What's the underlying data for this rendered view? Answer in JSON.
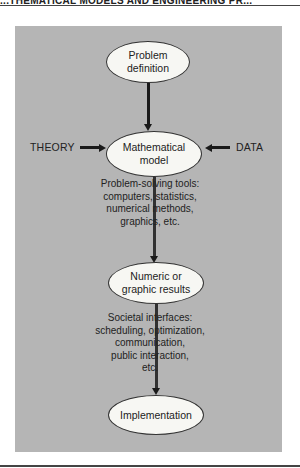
{
  "header": {
    "text": "...THEMATICAL MODELS AND ENGINEERING PR..."
  },
  "colors": {
    "panel": "#b5b5b5",
    "node_fill": "#f7f7f3",
    "line": "#1a1a1a"
  },
  "nodes": {
    "problem_definition": {
      "line1": "Problem",
      "line2": "definition"
    },
    "mathematical_model": {
      "line1": "Mathematical",
      "line2": "model"
    },
    "numeric_results": {
      "line1": "Numeric or",
      "line2": "graphic results"
    },
    "implementation": {
      "line1": "Implementation"
    }
  },
  "inputs": {
    "left": "THEORY",
    "right": "DATA"
  },
  "notes": {
    "tools": [
      "Problem-solving tools:",
      "computers, statistics,",
      "numerical methods,",
      "graphics, etc."
    ],
    "societal": [
      "Societal interfaces:",
      "scheduling, optimization,",
      "communication,",
      "public interaction,",
      "etc."
    ]
  }
}
